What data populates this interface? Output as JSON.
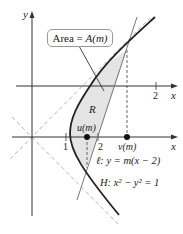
{
  "diagram": {
    "axis_labels": {
      "y": "y",
      "x_upper": "x",
      "x_lower": "x"
    },
    "ticks": {
      "upper_2": "2",
      "lower_1": "1",
      "lower_2": "2"
    },
    "callout": {
      "text_prefix": "Area = ",
      "text_func": "A(m)"
    },
    "region_label": "R",
    "points": {
      "u": "u(m)",
      "v": "v(m)"
    },
    "line_label": "ℓ: y = m(x − 2)",
    "hyperbola_label": "H: x² − y² = 1",
    "colors": {
      "curve": "#222222",
      "region_fill": "#e4e4e4",
      "dashed": "#aaaaaa",
      "axis": "#333333",
      "line": "#777777"
    }
  }
}
